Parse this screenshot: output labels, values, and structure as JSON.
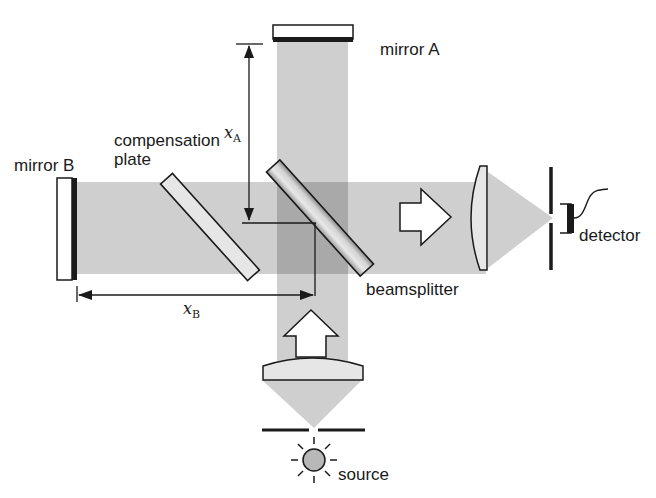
{
  "diagram": {
    "labels": {
      "mirror_a": "mirror A",
      "mirror_b": "mirror B",
      "compensation_line1": "compensation",
      "compensation_line2": "plate",
      "beamsplitter": "beamsplitter",
      "detector": "detector",
      "source": "source",
      "xa_var": "x",
      "xa_sub": "A",
      "xb_var": "x",
      "xb_sub": "B"
    },
    "colors": {
      "beam": "#cfcfcf",
      "beam_overlap": "#a9a9a9",
      "outline": "#1a1a1a",
      "source_fill": "#b8b8b8",
      "background": "#ffffff"
    },
    "components": [
      {
        "name": "mirror A",
        "icon": "mirror-icon"
      },
      {
        "name": "mirror B",
        "icon": "mirror-icon"
      },
      {
        "name": "compensation plate",
        "icon": "glass-plate-icon"
      },
      {
        "name": "beamsplitter",
        "icon": "beamsplitter-icon"
      },
      {
        "name": "collimating lens",
        "icon": "lens-icon"
      },
      {
        "name": "focusing lens",
        "icon": "lens-icon"
      },
      {
        "name": "detector",
        "icon": "detector-icon"
      },
      {
        "name": "source",
        "icon": "light-source-icon"
      }
    ]
  }
}
